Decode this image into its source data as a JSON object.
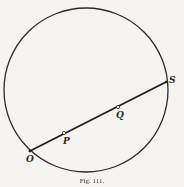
{
  "figure": {
    "type": "geometry-diagram",
    "circle": {
      "cx": 86,
      "cy": 90,
      "r": 82,
      "stroke": "#2b2b2b"
    },
    "chord": {
      "from": "O",
      "to": "S"
    },
    "points": [
      {
        "id": "O",
        "label": "O",
        "x": 30,
        "y": 151,
        "label_dx": -4,
        "label_dy": 11
      },
      {
        "id": "P",
        "label": "P",
        "x": 64,
        "y": 133,
        "label_dx": -1,
        "label_dy": 11
      },
      {
        "id": "Q",
        "label": "Q",
        "x": 118,
        "y": 107,
        "label_dx": -2,
        "label_dy": 11
      },
      {
        "id": "S",
        "label": "S",
        "x": 166,
        "y": 82,
        "label_dx": 3,
        "label_dy": 1
      }
    ]
  },
  "caption": {
    "text": "Fig. 111."
  }
}
